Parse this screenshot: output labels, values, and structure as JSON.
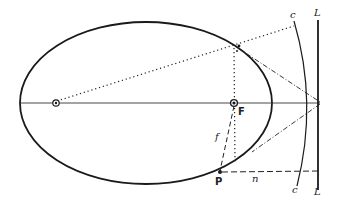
{
  "diagram": {
    "colors": {
      "ink": "#1a1a1a",
      "background": "#ffffff"
    },
    "labels": {
      "focus": "F",
      "point": "P",
      "focal_distance": "f",
      "normal_distance": "n",
      "directrix_top": "L",
      "directrix_bottom": "L",
      "curve_top": "c",
      "curve_bottom": "c"
    },
    "elements": [
      "ellipse",
      "major-axis",
      "left-focus",
      "right-focus-F",
      "directrix-L",
      "curve-c",
      "dotted-ray-from-left-focus",
      "dotted-vertical-through-F",
      "dash-dot-tangent-lines",
      "dashed-segment-F-to-P",
      "dashed-segment-P-to-L"
    ]
  }
}
